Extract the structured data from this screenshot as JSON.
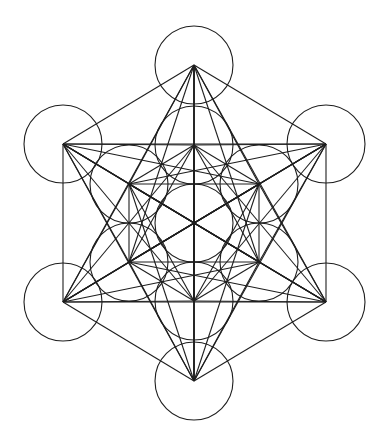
{
  "figure": {
    "name": "Metatron's Cube",
    "background": "#ffffff",
    "stroke_color": "#1e1e1e",
    "stroke_width": 1.1,
    "circle_radius": 39,
    "nodes": [
      {
        "id": "center",
        "x": 194,
        "y": 223
      },
      {
        "id": "inner-top",
        "x": 194,
        "y": 145
      },
      {
        "id": "inner-upper-right",
        "x": 259,
        "y": 184
      },
      {
        "id": "inner-lower-right",
        "x": 259,
        "y": 262
      },
      {
        "id": "inner-bottom",
        "x": 194,
        "y": 301
      },
      {
        "id": "inner-lower-left",
        "x": 129,
        "y": 262
      },
      {
        "id": "inner-upper-left",
        "x": 129,
        "y": 184
      },
      {
        "id": "outer-top",
        "x": 194,
        "y": 65
      },
      {
        "id": "outer-upper-right",
        "x": 326,
        "y": 144
      },
      {
        "id": "outer-lower-right",
        "x": 326,
        "y": 302
      },
      {
        "id": "outer-bottom",
        "x": 194,
        "y": 381
      },
      {
        "id": "outer-lower-left",
        "x": 63,
        "y": 302
      },
      {
        "id": "outer-upper-left",
        "x": 63,
        "y": 144
      }
    ],
    "connect_all_nodes": true
  }
}
